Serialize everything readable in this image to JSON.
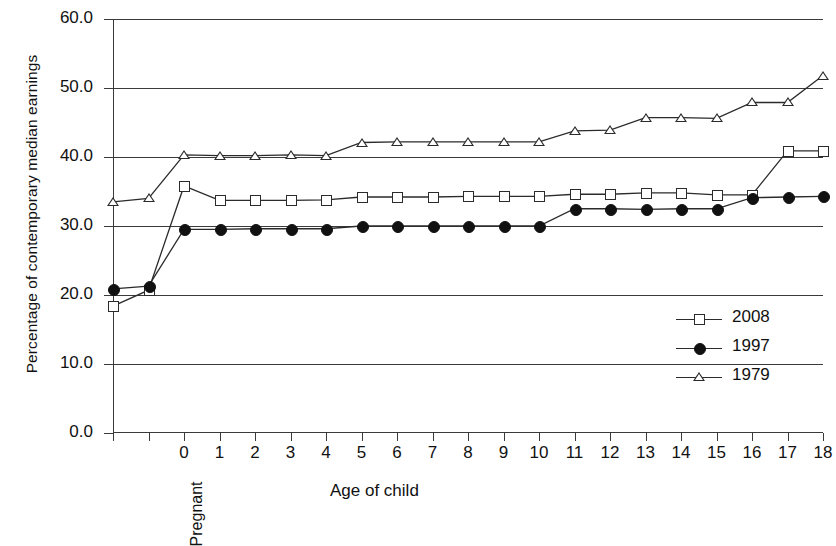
{
  "chart_data": {
    "type": "line",
    "title": "",
    "xlabel": "Age of child",
    "ylabel": "Percentage of contemporary median earnings",
    "ylim": [
      0,
      60
    ],
    "ytick_labels": [
      "0.0",
      "10.0",
      "20.0",
      "30.0",
      "40.0",
      "50.0",
      "60.0"
    ],
    "ytick_values": [
      0,
      10,
      20,
      30,
      40,
      50,
      60
    ],
    "grid": true,
    "legend_position": "right-inside",
    "categories": [
      "",
      "Pregnant",
      "0",
      "1",
      "2",
      "3",
      "4",
      "5",
      "6",
      "7",
      "8",
      "9",
      "10",
      "11",
      "12",
      "13",
      "14",
      "15",
      "16",
      "17",
      "18"
    ],
    "series": [
      {
        "name": "2008",
        "marker": "open-square",
        "values": [
          18.4,
          20.7,
          35.8,
          33.7,
          33.7,
          33.7,
          33.8,
          34.2,
          34.2,
          34.2,
          34.3,
          34.3,
          34.3,
          34.6,
          34.6,
          34.8,
          34.8,
          34.5,
          34.5,
          40.9,
          40.9
        ]
      },
      {
        "name": "1997",
        "marker": "filled-circle",
        "values": [
          20.9,
          21.3,
          29.5,
          29.5,
          29.6,
          29.6,
          29.6,
          30.0,
          30.0,
          30.0,
          30.0,
          30.0,
          30.0,
          32.5,
          32.5,
          32.4,
          32.5,
          32.5,
          34.1,
          34.2,
          34.3
        ]
      },
      {
        "name": "1979",
        "marker": "open-triangle",
        "values": [
          33.5,
          34.0,
          40.3,
          40.2,
          40.2,
          40.3,
          40.2,
          42.1,
          42.2,
          42.2,
          42.2,
          42.2,
          42.2,
          43.8,
          43.9,
          45.7,
          45.7,
          45.6,
          47.9,
          47.9,
          51.8
        ]
      }
    ]
  },
  "legend": {
    "entries": [
      {
        "label": "2008",
        "marker": "open-square"
      },
      {
        "label": "1997",
        "marker": "filled-circle"
      },
      {
        "label": "1979",
        "marker": "open-triangle"
      }
    ]
  },
  "axis": {
    "x_title": "Age of child",
    "y_title": "Percentage of contemporary median earnings"
  },
  "colors": {
    "line": "#2b2b2b",
    "axis": "#3a3a3a",
    "background": "#ffffff"
  }
}
